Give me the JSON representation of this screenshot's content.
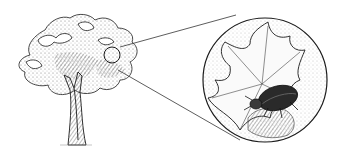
{
  "illustration": {
    "subject": "tree with magnified view of a beetle on a leaf",
    "colors": {
      "background": "#ffffff",
      "ink": "#1a1a1a",
      "shade": "#555555",
      "light": "#9a9a9a"
    },
    "tree": {
      "canopy_center": [
        95,
        60
      ],
      "trunk_base": [
        75,
        145
      ]
    },
    "magnifier_small": {
      "cx": 112,
      "cy": 55,
      "r": 8
    },
    "magnifier_large": {
      "cx": 265,
      "cy": 80,
      "r": 62
    },
    "callout_lines": [
      {
        "from": [
          120,
          47
        ],
        "to": [
          236,
          15
        ]
      },
      {
        "from": [
          118,
          70
        ],
        "to": [
          240,
          140
        ]
      }
    ]
  }
}
